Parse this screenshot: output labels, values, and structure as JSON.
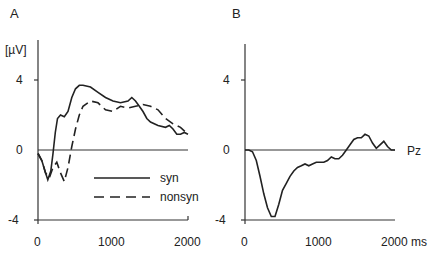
{
  "chart_data": [
    {
      "panel": "A",
      "type": "line",
      "title": "",
      "xlabel": "",
      "ylabel": "[µV]",
      "xlim": [
        0,
        2000
      ],
      "ylim": [
        -4,
        4
      ],
      "xticks": [
        0,
        1000,
        2000
      ],
      "yticks": [
        4,
        0,
        -4
      ],
      "grid": false,
      "legend_position": "lower-right",
      "series": [
        {
          "name": "syn",
          "style": "solid",
          "x": [
            0,
            50,
            100,
            130,
            170,
            200,
            230,
            260,
            300,
            350,
            400,
            450,
            500,
            550,
            600,
            700,
            800,
            900,
            1000,
            1100,
            1200,
            1250,
            1300,
            1350,
            1400,
            1450,
            1500,
            1600,
            1700,
            1750,
            1800,
            1850,
            1900,
            1950,
            2000
          ],
          "values": [
            -0.2,
            -0.6,
            -1.3,
            -1.7,
            -1.2,
            -0.2,
            1.0,
            1.8,
            2.0,
            1.9,
            2.2,
            3.0,
            3.5,
            3.7,
            3.7,
            3.6,
            3.3,
            3.0,
            2.8,
            2.7,
            2.8,
            3.0,
            2.8,
            2.5,
            2.2,
            1.8,
            1.6,
            1.4,
            1.3,
            1.4,
            1.2,
            0.9,
            0.9,
            1.0,
            0.9
          ]
        },
        {
          "name": "nonsyn",
          "style": "dashed",
          "x": [
            0,
            50,
            100,
            150,
            200,
            250,
            300,
            350,
            400,
            450,
            500,
            550,
            600,
            700,
            800,
            900,
            1000,
            1100,
            1200,
            1300,
            1400,
            1500,
            1600,
            1700,
            1800,
            1900,
            2000
          ],
          "values": [
            -0.2,
            -0.6,
            -1.3,
            -1.6,
            -1.0,
            -0.7,
            -1.3,
            -1.8,
            -1.0,
            0.2,
            1.2,
            2.0,
            2.5,
            2.8,
            2.7,
            2.3,
            2.2,
            2.5,
            2.4,
            2.5,
            2.6,
            2.5,
            2.3,
            1.8,
            1.5,
            1.3,
            0.9
          ]
        }
      ]
    },
    {
      "panel": "B",
      "type": "line",
      "title": "",
      "xlabel": "ms",
      "ylabel": "",
      "xlim": [
        0,
        2000
      ],
      "ylim": [
        -4,
        4
      ],
      "xticks": [
        0,
        1000,
        2000
      ],
      "yticks": [
        4,
        0,
        -4
      ],
      "grid": false,
      "annotation": "Pz",
      "series": [
        {
          "name": "difference",
          "style": "solid",
          "x": [
            0,
            50,
            100,
            150,
            200,
            250,
            300,
            350,
            400,
            450,
            500,
            550,
            600,
            650,
            700,
            750,
            800,
            850,
            900,
            950,
            1000,
            1050,
            1100,
            1150,
            1200,
            1250,
            1300,
            1350,
            1400,
            1450,
            1500,
            1550,
            1600,
            1650,
            1700,
            1750,
            1800,
            1850,
            1900,
            1950,
            2000
          ],
          "values": [
            0,
            0,
            -0.1,
            -0.6,
            -1.5,
            -2.5,
            -3.3,
            -3.8,
            -3.8,
            -3.1,
            -2.3,
            -1.9,
            -1.5,
            -1.2,
            -1.0,
            -0.9,
            -0.8,
            -0.9,
            -0.8,
            -0.7,
            -0.7,
            -0.7,
            -0.6,
            -0.4,
            -0.5,
            -0.5,
            -0.3,
            0.0,
            0.3,
            0.6,
            0.7,
            0.7,
            0.9,
            0.8,
            0.4,
            0.1,
            0.3,
            0.5,
            0.2,
            0.0,
            0.0
          ]
        }
      ]
    }
  ],
  "labels": {
    "panel_a": "A",
    "panel_b": "B",
    "y_unit": "[µV]",
    "annotation_b": "Pz",
    "legend": [
      "syn",
      "nonsyn"
    ],
    "a_yticks": [
      "4",
      "0",
      "-4"
    ],
    "a_xticks": [
      "0",
      "1000",
      "2000"
    ],
    "b_yticks": [
      "4",
      "0",
      "-4"
    ],
    "b_xticks": [
      "0",
      "1000",
      "2000 ms"
    ]
  }
}
